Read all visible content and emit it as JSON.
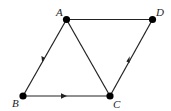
{
  "diagram": {
    "type": "directed-graph",
    "colors": {
      "edge": "#222222",
      "node": "#000000",
      "label": "#222222",
      "background": "#ffffff"
    },
    "nodes": [
      {
        "id": "A",
        "label": "A",
        "x": 66.5,
        "y": 19.5,
        "label_x": 56,
        "label_y": 16
      },
      {
        "id": "B",
        "label": "B",
        "x": 23,
        "y": 96,
        "label_x": 12,
        "label_y": 107
      },
      {
        "id": "C",
        "label": "C",
        "x": 110,
        "y": 96,
        "label_x": 113,
        "label_y": 108
      },
      {
        "id": "D",
        "label": "D",
        "x": 152.5,
        "y": 19.5,
        "label_x": 156,
        "label_y": 16
      }
    ],
    "edges": [
      {
        "from": "A",
        "to": "D",
        "directed": false
      },
      {
        "from": "A",
        "to": "B",
        "directed": true
      },
      {
        "from": "A",
        "to": "C",
        "directed": false
      },
      {
        "from": "B",
        "to": "C",
        "directed": true
      },
      {
        "from": "C",
        "to": "D",
        "directed": true
      }
    ]
  }
}
